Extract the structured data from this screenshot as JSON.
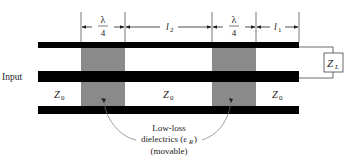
{
  "diagram": {
    "input_label": "Input",
    "load_label": "Z",
    "load_sub": "L",
    "sections": [
      {
        "id": "quarter_wave_1",
        "dim_num": "λ",
        "dim_den": "4"
      },
      {
        "id": "gap_l2",
        "dim_label": "l",
        "dim_sub": "2"
      },
      {
        "id": "quarter_wave_2",
        "dim_num": "λ",
        "dim_den": "4"
      },
      {
        "id": "gap_l1",
        "dim_label": "l",
        "dim_sub": "1"
      }
    ],
    "impedance_labels": [
      {
        "text": "Z",
        "sub": "0"
      },
      {
        "text": "Z",
        "sub": "0"
      },
      {
        "text": "Z",
        "sub": "0"
      }
    ],
    "annotation": {
      "line1": "Low-loss",
      "line2_prefix": "dielectrics (ε",
      "line2_sub": "R",
      "line2_suffix": ")",
      "line3": "(movable)"
    },
    "colors": {
      "conductor": "#000000",
      "dielectric": "#8a8a8a",
      "line": "#444444"
    }
  }
}
